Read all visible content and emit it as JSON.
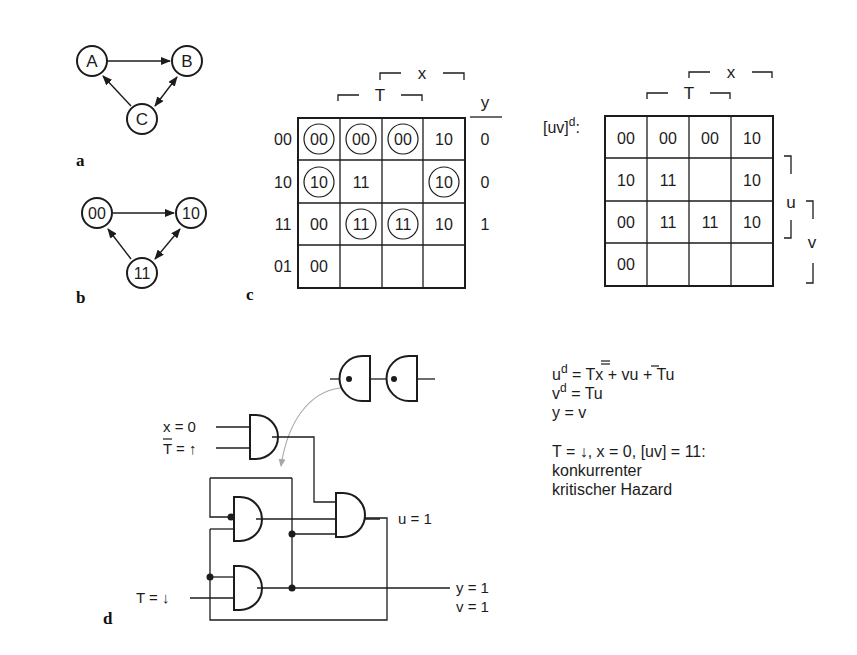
{
  "panels": {
    "a": {
      "label": "a",
      "nodes": [
        {
          "id": "A",
          "text": "A",
          "cx": 92,
          "cy": 61
        },
        {
          "id": "B",
          "text": "B",
          "cx": 187,
          "cy": 61
        },
        {
          "id": "C",
          "text": "C",
          "cx": 142,
          "cy": 119
        }
      ],
      "edges": [
        {
          "from": "A",
          "to": "B",
          "type": "arrow"
        },
        {
          "from": "C",
          "to": "A",
          "type": "arrow"
        },
        {
          "from": "C",
          "to": "B",
          "type": "double-arrow"
        }
      ]
    },
    "b": {
      "label": "b",
      "nodes": [
        {
          "id": "00",
          "text": "00",
          "cx": 97,
          "cy": 213
        },
        {
          "id": "10",
          "text": "10",
          "cx": 191,
          "cy": 213
        },
        {
          "id": "11",
          "text": "11",
          "cx": 142,
          "cy": 273
        }
      ],
      "edges": [
        {
          "from": "00",
          "to": "10",
          "type": "arrow"
        },
        {
          "from": "11",
          "to": "00",
          "type": "arrow"
        },
        {
          "from": "11",
          "to": "10",
          "type": "double-arrow"
        }
      ]
    },
    "c": {
      "label": "c",
      "top_labels": {
        "x": "x",
        "T": "T"
      },
      "output_header": "y",
      "row_labels": [
        "00",
        "10",
        "11",
        "01"
      ],
      "cells": [
        [
          {
            "v": "00",
            "circled": true
          },
          {
            "v": "00",
            "circled": true
          },
          {
            "v": "00",
            "circled": true
          },
          {
            "v": "10",
            "circled": false
          }
        ],
        [
          {
            "v": "10",
            "circled": true
          },
          {
            "v": "11",
            "circled": false
          },
          {
            "v": "",
            "circled": false
          },
          {
            "v": "10",
            "circled": true
          }
        ],
        [
          {
            "v": "00",
            "circled": false
          },
          {
            "v": "11",
            "circled": true
          },
          {
            "v": "11",
            "circled": true
          },
          {
            "v": "10",
            "circled": false
          }
        ],
        [
          {
            "v": "00",
            "circled": false
          },
          {
            "v": "",
            "circled": false
          },
          {
            "v": "",
            "circled": false
          },
          {
            "v": "",
            "circled": false
          }
        ]
      ],
      "outputs": [
        "0",
        "0",
        "1",
        ""
      ]
    },
    "next_state_map": {
      "title": "[uv]",
      "title_sup": "d",
      "title_suffix": ":",
      "top_labels": {
        "x": "x",
        "T": "T"
      },
      "side_labels": {
        "u": "u",
        "v": "v"
      },
      "cells": [
        [
          "00",
          "00",
          "00",
          "10"
        ],
        [
          "10",
          "11",
          "",
          "10"
        ],
        [
          "00",
          "11",
          "11",
          "10"
        ],
        [
          "00",
          "",
          "",
          ""
        ]
      ]
    },
    "d": {
      "label": "d",
      "inputs": {
        "x": "x = 0",
        "Tbar_base": "T",
        "Tbar_rest": " = ↑",
        "T": "T = ↓"
      },
      "outputs": {
        "u": "u = 1",
        "y": "y = 1",
        "v": "v = 1"
      }
    }
  },
  "equations": {
    "ud_base": "u",
    "ud_sup": "d",
    "ud_rhs_1": " = ",
    "ud_T": "T",
    "ud_rhs_2": "x + ",
    "ud_v": "v",
    "ud_rhs_3": "u + Tu",
    "vd_base": "v",
    "vd_sup": "d",
    "vd_rhs": " = Tu",
    "y_eq": "y = v",
    "condition": "T = ↓, x = 0, [uv] = 11:",
    "hazard_line1": "konkurrenter",
    "hazard_line2": "kritischer Hazard"
  },
  "colors": {
    "ink": "#1c1c1c",
    "arrow_gray": "#a8a8a8",
    "background": "#ffffff"
  }
}
